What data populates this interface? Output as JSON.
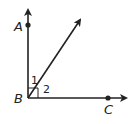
{
  "diagram": {
    "type": "geometry-angles",
    "points": {
      "A": {
        "label": "A",
        "x": 28,
        "y": 25
      },
      "B": {
        "label": "B",
        "x": 28,
        "y": 98
      },
      "C": {
        "label": "C",
        "x": 108,
        "y": 98
      }
    },
    "rays": [
      {
        "name": "BA",
        "from": "B",
        "direction": "up"
      },
      {
        "name": "BC",
        "from": "B",
        "direction": "right"
      },
      {
        "name": "diagonal",
        "from": "B",
        "direction": "upper-right"
      }
    ],
    "angles": [
      {
        "label": "1",
        "between": [
          "BA",
          "diagonal"
        ]
      },
      {
        "label": "2",
        "between": [
          "diagonal",
          "BC"
        ]
      }
    ],
    "right_angle_marker": {
      "at": "B",
      "between": [
        "BA",
        "BC"
      ]
    },
    "colors": {
      "stroke": "#222222",
      "background": "#ffffff"
    }
  }
}
